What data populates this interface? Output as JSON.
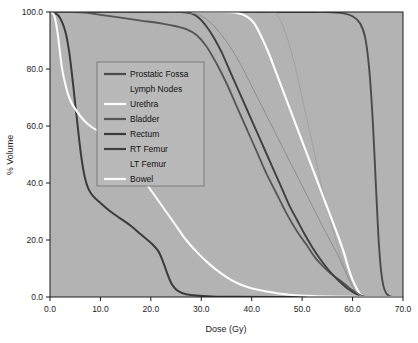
{
  "chart_data": {
    "type": "line",
    "title": "",
    "xlabel": "Dose (Gy)",
    "ylabel": "% Volume",
    "xlim": [
      0,
      70
    ],
    "ylim": [
      0,
      100
    ],
    "xticks": [
      "0.0",
      "10.0",
      "20.0",
      "30.0",
      "40.0",
      "50.0",
      "60.0",
      "70.0"
    ],
    "yticks": [
      "0.0",
      "20.0",
      "40.0",
      "60.0",
      "80.0",
      "100.0"
    ],
    "xtick_values": [
      0,
      10,
      20,
      30,
      40,
      50,
      60,
      70
    ],
    "ytick_values": [
      0,
      20,
      40,
      60,
      80,
      100
    ],
    "grid": false,
    "legend_position": "upper-left-inside",
    "plot_background": "#b3b3b3",
    "figure_background": "#ffffff",
    "series": [
      {
        "name": "Prostatic Fossa",
        "color": "#4a4a4a",
        "width": 1.9,
        "points": [
          [
            0,
            100
          ],
          [
            10,
            100
          ],
          [
            20,
            100
          ],
          [
            30,
            100
          ],
          [
            40,
            100
          ],
          [
            50,
            100
          ],
          [
            55,
            100
          ],
          [
            58,
            99.6
          ],
          [
            60,
            98.5
          ],
          [
            61.5,
            96
          ],
          [
            62.5,
            91
          ],
          [
            63.3,
            80
          ],
          [
            64,
            62
          ],
          [
            64.6,
            40
          ],
          [
            65.1,
            22
          ],
          [
            65.6,
            10
          ],
          [
            66.1,
            4
          ],
          [
            66.7,
            1.2
          ],
          [
            67.4,
            0.2
          ],
          [
            68,
            0
          ]
        ]
      },
      {
        "name": "Lymph Nodes",
        "color": "#a2a2a2",
        "width": 1.0,
        "points": [
          [
            0,
            100
          ],
          [
            20,
            100
          ],
          [
            35,
            100
          ],
          [
            44,
            100
          ],
          [
            45,
            99
          ],
          [
            46,
            96
          ],
          [
            47,
            91
          ],
          [
            48,
            85
          ],
          [
            49,
            78
          ],
          [
            50,
            70
          ],
          [
            51,
            62
          ],
          [
            52,
            54
          ],
          [
            53,
            46
          ],
          [
            54,
            38
          ],
          [
            55,
            31
          ],
          [
            56,
            24
          ],
          [
            57,
            18
          ],
          [
            58,
            12.5
          ],
          [
            59,
            8
          ],
          [
            60,
            4.5
          ],
          [
            61,
            2
          ],
          [
            61.8,
            0.7
          ],
          [
            62.5,
            0
          ]
        ]
      },
      {
        "name": "Urethra",
        "color": "#ffffff",
        "width": 2.1,
        "points": [
          [
            0,
            100
          ],
          [
            20,
            100
          ],
          [
            34,
            100
          ],
          [
            37,
            99.7
          ],
          [
            39,
            98.5
          ],
          [
            40.5,
            96
          ],
          [
            42,
            91
          ],
          [
            43.5,
            85
          ],
          [
            45,
            78
          ],
          [
            46.5,
            71
          ],
          [
            48,
            64
          ],
          [
            49.5,
            57
          ],
          [
            51,
            50
          ],
          [
            52.5,
            43
          ],
          [
            54,
            36
          ],
          [
            55.5,
            29
          ],
          [
            57,
            22
          ],
          [
            58.2,
            16
          ],
          [
            59.2,
            10
          ],
          [
            60,
            6
          ],
          [
            60.8,
            3
          ],
          [
            61.5,
            1
          ],
          [
            62.2,
            0
          ]
        ]
      },
      {
        "name": "Bladder",
        "color": "#555555",
        "width": 1.8,
        "points": [
          [
            0,
            100
          ],
          [
            4,
            100
          ],
          [
            7,
            99.8
          ],
          [
            10,
            99
          ],
          [
            14,
            98
          ],
          [
            18,
            97
          ],
          [
            22,
            96
          ],
          [
            25,
            95
          ],
          [
            27,
            94
          ],
          [
            29,
            92
          ],
          [
            31,
            88
          ],
          [
            33,
            82
          ],
          [
            35,
            75
          ],
          [
            37,
            67
          ],
          [
            39,
            59
          ],
          [
            41,
            51
          ],
          [
            43,
            43
          ],
          [
            45,
            36
          ],
          [
            47,
            29
          ],
          [
            49,
            23
          ],
          [
            51,
            18
          ],
          [
            52.5,
            14
          ],
          [
            54,
            11
          ],
          [
            55.5,
            8.5
          ],
          [
            57,
            6.5
          ],
          [
            58.5,
            4.5
          ],
          [
            59.5,
            3
          ],
          [
            60.5,
            1.8
          ],
          [
            61.3,
            0.9
          ],
          [
            62,
            0.3
          ],
          [
            62.6,
            0
          ]
        ]
      },
      {
        "name": "Rectum",
        "color": "#3b3b3b",
        "width": 2.0,
        "points": [
          [
            0,
            100
          ],
          [
            1.5,
            99
          ],
          [
            2.5,
            96
          ],
          [
            3.2,
            92
          ],
          [
            3.8,
            86
          ],
          [
            4.3,
            79
          ],
          [
            4.8,
            71
          ],
          [
            5.3,
            63
          ],
          [
            5.8,
            55
          ],
          [
            6.3,
            48
          ],
          [
            6.9,
            42
          ],
          [
            7.6,
            38
          ],
          [
            8.5,
            35.5
          ],
          [
            10,
            33
          ],
          [
            12,
            30
          ],
          [
            14,
            27.5
          ],
          [
            16,
            25
          ],
          [
            18,
            22
          ],
          [
            20,
            19
          ],
          [
            21.5,
            16
          ],
          [
            22.5,
            12
          ],
          [
            23.3,
            8
          ],
          [
            24,
            5
          ],
          [
            24.8,
            3
          ],
          [
            25.8,
            1.7
          ],
          [
            27,
            1
          ],
          [
            29,
            0.5
          ],
          [
            32,
            0.2
          ],
          [
            36,
            0.1
          ],
          [
            45,
            0
          ],
          [
            70,
            0
          ]
        ]
      },
      {
        "name": "RT Femur",
        "color": "#3f3f3f",
        "width": 1.9,
        "points": [
          [
            0,
            100
          ],
          [
            10,
            100
          ],
          [
            20,
            100
          ],
          [
            26,
            100
          ],
          [
            28,
            99.5
          ],
          [
            29.5,
            98
          ],
          [
            31,
            95
          ],
          [
            32.5,
            91
          ],
          [
            34,
            86
          ],
          [
            35.5,
            80
          ],
          [
            37,
            74
          ],
          [
            38.5,
            68
          ],
          [
            40,
            62
          ],
          [
            41.5,
            56
          ],
          [
            43,
            50
          ],
          [
            44.5,
            44
          ],
          [
            46,
            38
          ],
          [
            47.5,
            32
          ],
          [
            49,
            27
          ],
          [
            50.5,
            22
          ],
          [
            52,
            17.5
          ],
          [
            53.5,
            13.5
          ],
          [
            55,
            10
          ],
          [
            56.5,
            7
          ],
          [
            58,
            4.5
          ],
          [
            59,
            3
          ],
          [
            60,
            1.8
          ],
          [
            60.8,
            1
          ],
          [
            61.5,
            0.4
          ],
          [
            62.2,
            0
          ]
        ]
      },
      {
        "name": "LT Femur",
        "color": "#8d8d8d",
        "width": 1.0,
        "points": [
          [
            0,
            100
          ],
          [
            15,
            100
          ],
          [
            25,
            100
          ],
          [
            28,
            99.6
          ],
          [
            30,
            98.6
          ],
          [
            32,
            96
          ],
          [
            34,
            92
          ],
          [
            36,
            87
          ],
          [
            38,
            81
          ],
          [
            40,
            74
          ],
          [
            42,
            67
          ],
          [
            44,
            60
          ],
          [
            46,
            53
          ],
          [
            48,
            46
          ],
          [
            50,
            39
          ],
          [
            52,
            32
          ],
          [
            54,
            25
          ],
          [
            55.5,
            20
          ],
          [
            57,
            15
          ],
          [
            58.3,
            10
          ],
          [
            59.3,
            6
          ],
          [
            60.2,
            3
          ],
          [
            61,
            1.2
          ],
          [
            61.7,
            0.3
          ],
          [
            62.3,
            0
          ]
        ]
      },
      {
        "name": "Bowel",
        "color": "#fbfbfb",
        "width": 2.1,
        "points": [
          [
            0,
            100
          ],
          [
            0.8,
            99
          ],
          [
            1.3,
            95
          ],
          [
            1.7,
            90
          ],
          [
            2.1,
            84
          ],
          [
            2.5,
            79
          ],
          [
            3,
            75
          ],
          [
            3.6,
            71
          ],
          [
            4.3,
            68
          ],
          [
            5,
            66
          ],
          [
            6,
            63.5
          ],
          [
            7,
            61.5
          ],
          [
            8,
            60
          ],
          [
            9,
            58.8
          ],
          [
            10,
            58
          ],
          [
            11,
            57
          ],
          [
            13,
            54
          ],
          [
            15,
            50
          ],
          [
            17,
            45
          ],
          [
            19,
            40
          ],
          [
            21,
            35
          ],
          [
            23,
            30
          ],
          [
            25,
            25
          ],
          [
            27,
            20
          ],
          [
            29,
            16
          ],
          [
            31,
            12.5
          ],
          [
            33,
            9.5
          ],
          [
            35,
            7
          ],
          [
            37,
            5
          ],
          [
            39,
            3.6
          ],
          [
            41,
            2.6
          ],
          [
            43,
            1.9
          ],
          [
            45,
            1.3
          ],
          [
            47,
            0.9
          ],
          [
            49,
            0.6
          ],
          [
            51,
            0.4
          ],
          [
            53,
            0.25
          ],
          [
            56,
            0.15
          ],
          [
            60,
            0.05
          ],
          [
            65,
            0
          ],
          [
            70,
            0
          ]
        ]
      }
    ]
  },
  "legend": {
    "items": [
      {
        "label": "Prostatic Fossa",
        "color": "#4a4a4a",
        "swatch": true
      },
      {
        "label": "Lymph Nodes",
        "color": "#a8a8a8",
        "swatch": false
      },
      {
        "label": "Urethra",
        "color": "#ffffff",
        "swatch": true
      },
      {
        "label": "Bladder",
        "color": "#555555",
        "swatch": true
      },
      {
        "label": "Rectum",
        "color": "#3b3b3b",
        "swatch": true
      },
      {
        "label": "RT Femur",
        "color": "#3f3f3f",
        "swatch": true
      },
      {
        "label": "LT Femur",
        "color": "#999999",
        "swatch": false
      },
      {
        "label": "Bowel",
        "color": "#fbfbfb",
        "swatch": true
      }
    ]
  }
}
